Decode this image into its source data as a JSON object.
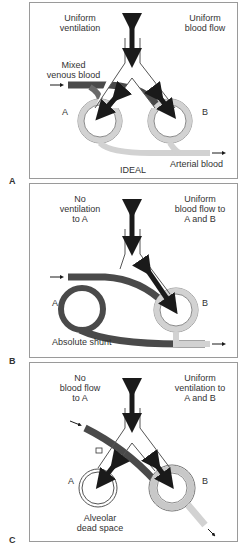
{
  "panels": [
    {
      "letter": "A",
      "left_label": "Uniform\nventilation",
      "right_label": "Uniform\nblood flow",
      "inflow_label": "Mixed\nvenous blood",
      "alveolus_a": "A",
      "alveolus_b": "B",
      "center_label": "IDEAL",
      "outflow_label": "Arterial blood"
    },
    {
      "letter": "B",
      "left_label": "No\nventilation\nto A",
      "right_label": "Uniform\nblood flow to\nA and B",
      "alveolus_a": "A",
      "alveolus_b": "B",
      "bottom_label": "Absolute shunt"
    },
    {
      "letter": "C",
      "left_label": "No\nblood flow\nto A",
      "right_label": "Uniform\nventilation to\nA and B",
      "alveolus_a": "A",
      "alveolus_b": "B",
      "bottom_label": "Alveolar\ndead space"
    }
  ],
  "colors": {
    "venous_blood": "#4a4a4a",
    "arterial_blood": "#d2d2d2",
    "airway": "#ffffff",
    "arrow": "#1a1a1a",
    "border": "#9a9a9a"
  }
}
